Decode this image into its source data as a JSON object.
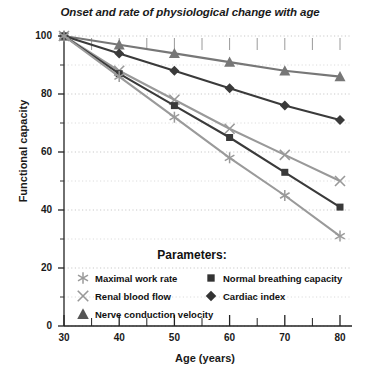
{
  "chart_data": {
    "type": "line",
    "title": "Onset and rate of physiological change with age",
    "xlabel": "Age (years)",
    "ylabel": "Functional capacity",
    "xlim": [
      30,
      80
    ],
    "ylim": [
      0,
      100
    ],
    "xticks": [
      30,
      40,
      50,
      60,
      70,
      80
    ],
    "yticks": [
      0,
      20,
      40,
      60,
      80,
      100
    ],
    "xtick_minor_step": 5,
    "ytick_minor_step": 10,
    "grid": "horizontal-dotted",
    "legend_position": "inside-lower-center",
    "legend_title": "Parameters:",
    "x": [
      30,
      40,
      50,
      60,
      70,
      80
    ],
    "series": [
      {
        "name": "Nerve conduction velocity",
        "marker": "triangle",
        "color": "#777777",
        "values": [
          100,
          97,
          94,
          91,
          88,
          86
        ]
      },
      {
        "name": "Cardiac index",
        "marker": "diamond",
        "color": "#3a3a3a",
        "values": [
          100,
          94,
          88,
          82,
          76,
          71
        ]
      },
      {
        "name": "Renal blood flow",
        "marker": "x",
        "color": "#999999",
        "values": [
          100,
          88,
          78,
          68,
          59,
          50
        ]
      },
      {
        "name": "Normal breathing capacity",
        "marker": "square",
        "color": "#3a3a3a",
        "values": [
          100,
          87,
          76,
          65,
          53,
          41
        ]
      },
      {
        "name": "Maximal work rate",
        "marker": "asterisk",
        "color": "#9a9a9a",
        "values": [
          100,
          86,
          72,
          58,
          45,
          31
        ]
      }
    ],
    "legend_entries_left": [
      {
        "label": "Maximal work rate",
        "marker": "asterisk",
        "color": "#9a9a9a"
      },
      {
        "label": "Renal blood flow",
        "marker": "x",
        "color": "#999999"
      },
      {
        "label": "Nerve conduction velocity",
        "marker": "triangle",
        "color": "#555555"
      }
    ],
    "legend_entries_right": [
      {
        "label": "Normal breathing capacity",
        "marker": "square",
        "color": "#333333"
      },
      {
        "label": "Cardiac index",
        "marker": "diamond",
        "color": "#333333"
      }
    ]
  }
}
